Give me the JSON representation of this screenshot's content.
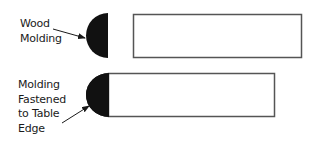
{
  "diagram": {
    "top": {
      "label_lines": [
        "Wood",
        "Molding"
      ],
      "molding": {
        "shape": "half-circle",
        "fill": "#111111"
      },
      "board": {
        "shape": "rectangle",
        "stroke": "#555555",
        "fill": "#ffffff"
      },
      "arrow": "arrow-pointing-to-molding"
    },
    "bottom": {
      "label_lines": [
        "Molding",
        "Fastened",
        "to Table",
        "Edge"
      ],
      "molding": {
        "shape": "half-circle",
        "fill": "#111111"
      },
      "board": {
        "shape": "rectangle",
        "stroke": "#555555",
        "fill": "#ffffff"
      },
      "arrow": "arrow-pointing-to-molding"
    }
  }
}
